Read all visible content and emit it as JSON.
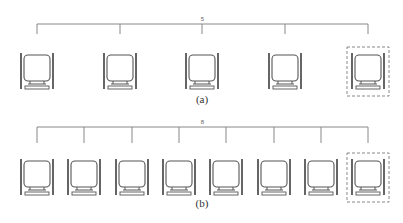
{
  "diagrams": [
    {
      "id": "a",
      "caption": "(a)",
      "count_label": "5",
      "leaf_count": 5,
      "highlighted_index": 4,
      "bar_y": 24,
      "bar_x1": 37,
      "bar_x2": 368,
      "leaf_centers": [
        37,
        120,
        202,
        285,
        368
      ],
      "chair_top": 53,
      "caption_y": 93,
      "count_y": 16
    },
    {
      "id": "b",
      "caption": "(b)",
      "count_label": "8",
      "leaf_count": 8,
      "highlighted_index": 7,
      "bar_y": 127,
      "bar_x1": 37,
      "bar_x2": 368,
      "leaf_centers": [
        37,
        84,
        132,
        179,
        226,
        274,
        321,
        368
      ],
      "chair_top": 159,
      "caption_y": 197,
      "count_y": 119
    }
  ],
  "colors": {
    "line": "#888888",
    "chair": "#555555",
    "dash": "#888888"
  }
}
